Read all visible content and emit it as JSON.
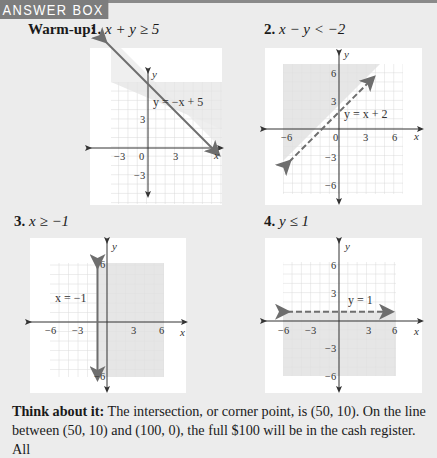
{
  "header": {
    "title": "ANSWER BOX"
  },
  "warmup": {
    "label": "Warm-up:",
    "problems": [
      {
        "number": "1.",
        "inequality": "x + y ≥ 5",
        "line_equation": "y = −x + 5",
        "boundary": "solid",
        "shade": "above"
      },
      {
        "number": "2.",
        "inequality": "x − y < −2",
        "line_equation": "y = x + 2",
        "boundary": "dashed",
        "shade": "above"
      },
      {
        "number": "3.",
        "inequality": "x ≥ −1",
        "line_equation": "x = −1",
        "boundary": "solid",
        "shade": "right"
      },
      {
        "number": "4.",
        "inequality": "y ≤ 1",
        "line_equation": "y = 1",
        "boundary": "dashed",
        "shade": "below"
      }
    ]
  },
  "graphs": [
    {
      "ticks_x": [
        "−3",
        "0",
        "3"
      ],
      "ticks_y": [
        "3",
        "−3"
      ],
      "x_label": "x",
      "y_label": "y"
    },
    {
      "ticks_x": [
        "−6",
        "0",
        "3",
        "6"
      ],
      "ticks_y": [
        "6",
        "3",
        "−3",
        "−6"
      ],
      "x_label": "x",
      "y_label": "y"
    },
    {
      "ticks_x": [
        "−6",
        "−3",
        "3",
        "6"
      ],
      "ticks_y": [
        "6",
        "−6"
      ],
      "x_label": "x",
      "y_label": "y"
    },
    {
      "ticks_x": [
        "−6",
        "−3",
        "3",
        "6"
      ],
      "ticks_y": [
        "6",
        "3",
        "−3",
        "−6"
      ],
      "x_label": "x",
      "y_label": "y"
    }
  ],
  "footer": {
    "lead": "Think about it:",
    "text": " The intersection, or corner point, is (50, 10). On the line between (50, 10) and (100, 0), the full $100 will be in the cash register. All"
  },
  "colors": {
    "page_bg": "#ececec",
    "header_bg": "#7d7d7d",
    "panel_bg": "#ffffff",
    "shade": "#e8e8e8",
    "grid": "#d8d8d8",
    "line": "#6e6e6e"
  }
}
